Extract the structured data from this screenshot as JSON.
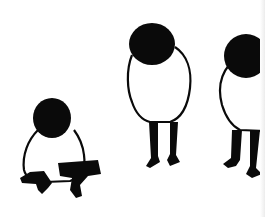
{
  "illustration": {
    "description": "Black ink drawing of three round-headed figures",
    "colors": {
      "ink": "#0a0a0a",
      "paper": "#ffffff"
    },
    "figures": [
      {
        "id": "crouching-figure",
        "pose": "squatting"
      },
      {
        "id": "standing-figure-center",
        "pose": "standing, head bowed"
      },
      {
        "id": "standing-figure-right",
        "pose": "standing, partially cropped"
      }
    ]
  }
}
